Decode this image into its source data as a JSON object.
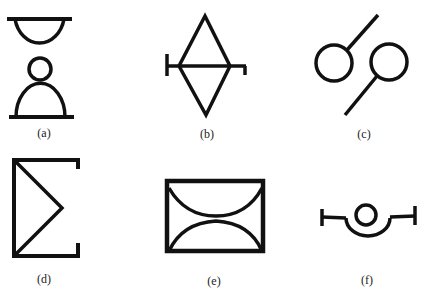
{
  "figure": {
    "stroke_color": "#111111",
    "background": "#ffffff",
    "panels": [
      {
        "id": "a",
        "label": "(a)",
        "description": "hourglass: two half-domes with a small circle between, bars on top and bottom"
      },
      {
        "id": "b",
        "label": "(b)",
        "description": "diamond bisected by a horizontal bar with end ticks"
      },
      {
        "id": "c",
        "label": "(c)",
        "description": "two circles each with a diagonal stem"
      },
      {
        "id": "d",
        "label": "(d)",
        "description": "sigma-like bracket shape"
      },
      {
        "id": "e",
        "label": "(e)",
        "description": "rectangle with two facing arcs"
      },
      {
        "id": "f",
        "label": "(f)",
        "description": "circle in a cup with flanking T-bars"
      }
    ]
  }
}
